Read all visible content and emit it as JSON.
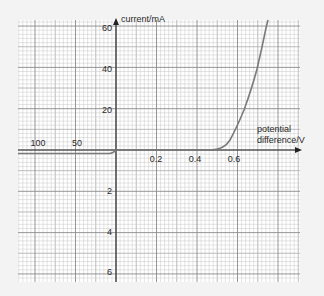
{
  "chart_data": {
    "type": "line",
    "title": "",
    "xlabel": "potential difference/V",
    "ylabel": "current/mA",
    "x_axis": {
      "positive_ticks": [
        0.2,
        0.4,
        0.6
      ],
      "positive_tick_labels": [
        "0.2",
        "0.4",
        "0.6"
      ],
      "negative_ticks": [
        -50,
        -100
      ],
      "negative_tick_labels": [
        "50",
        "100"
      ],
      "positive_range": [
        0,
        0.74
      ],
      "negative_range": [
        -125,
        0
      ]
    },
    "y_axis": {
      "positive_ticks": [
        20,
        40,
        60
      ],
      "positive_tick_labels": [
        "20",
        "40",
        "60"
      ],
      "negative_ticks": [
        -2,
        -4,
        -6
      ],
      "negative_tick_labels": [
        "2",
        "4",
        "6"
      ],
      "positive_range": [
        0,
        63
      ],
      "negative_range": [
        -6.5,
        0
      ]
    },
    "grid": true,
    "legend": "none",
    "series": [
      {
        "name": "diode I-V characteristic",
        "x": [
          -125,
          -100,
          -50,
          -5,
          0,
          0.2,
          0.4,
          0.5,
          0.55,
          0.58,
          0.6,
          0.62,
          0.64,
          0.66,
          0.68,
          0.7
        ],
        "y": [
          -0.2,
          -0.2,
          -0.2,
          -0.2,
          0,
          0,
          0,
          0,
          0.5,
          3,
          8,
          16,
          25,
          36,
          48,
          60
        ]
      }
    ]
  },
  "labels": {
    "y_axis_title": "current/mA",
    "x_axis_title_line1": "potential",
    "x_axis_title_line2": "difference/V",
    "y60": "60",
    "y40": "40",
    "y20": "20",
    "yn2": "2",
    "yn4": "4",
    "yn6": "6",
    "x02": "0.2",
    "x04": "0.4",
    "x06": "0.6",
    "xn100": "100",
    "xn50": "50"
  },
  "colors": {
    "background": "#f3f3f3",
    "paper": "#ffffff",
    "grid_minor": "#c8c8c8",
    "grid_major": "#8a8a8a",
    "axis": "#333333",
    "curve": "#7a7a7a"
  }
}
